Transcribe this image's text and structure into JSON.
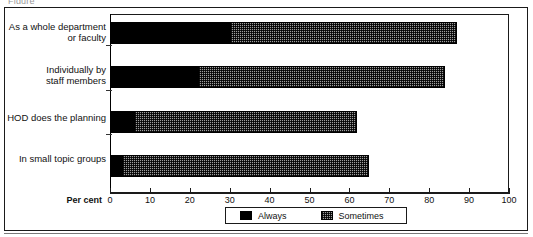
{
  "figure": {
    "clipped_caption": "Figure",
    "axis_title": "Per cent",
    "colors": {
      "always": "#000000",
      "sometimes": "#9d9d9d",
      "frame": "#1a1a1a",
      "background": "#ffffff"
    }
  },
  "legend": {
    "position": "bottom-center",
    "entries": [
      {
        "label": "Always",
        "pattern": "solid-black"
      },
      {
        "label": "Sometimes",
        "pattern": "checkered-grey"
      }
    ]
  },
  "chart_data": {
    "type": "bar",
    "orientation": "horizontal",
    "stacked": true,
    "title": "",
    "subtitle": "",
    "xlabel": "Per cent",
    "ylabel": "",
    "xlim": [
      0,
      100
    ],
    "ylim": null,
    "grid": false,
    "legend_position": "bottom-center",
    "categories": [
      "As a whole department\nor faculty",
      "Individually by\nstaff members",
      "HOD does the planning",
      "In small topic groups"
    ],
    "xticks": [
      0,
      10,
      20,
      30,
      40,
      50,
      60,
      70,
      80,
      90,
      100
    ],
    "xticklabels": [
      "0",
      "10",
      "20",
      "30",
      "40",
      "50",
      "60",
      "70",
      "80",
      "90",
      "100"
    ],
    "series": [
      {
        "name": "Always",
        "values": [
          30,
          22,
          6,
          3
        ]
      },
      {
        "name": "Sometimes",
        "values": [
          57,
          62,
          56,
          62
        ]
      }
    ],
    "totals": [
      87,
      84,
      62,
      65
    ],
    "annotations": []
  }
}
